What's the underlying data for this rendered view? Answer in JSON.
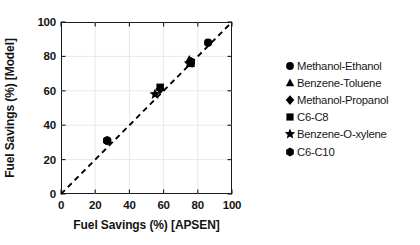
{
  "chart_data": {
    "type": "scatter",
    "title": "",
    "xlabel": "Fuel Savings (%) [APSEN]",
    "ylabel": "Fuel Savings (%) [Model]",
    "xlim": [
      0,
      100
    ],
    "ylim": [
      0,
      100
    ],
    "xticks": [
      0,
      20,
      40,
      60,
      80,
      100
    ],
    "yticks": [
      0,
      20,
      40,
      60,
      80,
      100
    ],
    "xtick_labels": [
      "0",
      "20",
      "40",
      "60",
      "80",
      "100"
    ],
    "ytick_labels": [
      "0",
      "20",
      "40",
      "60",
      "80",
      "100"
    ],
    "grid": true,
    "legend_position": "right",
    "reference_line": {
      "name": "parity-line",
      "style": "dashed",
      "from": [
        0,
        0
      ],
      "to": [
        100,
        100
      ],
      "color": "#000000"
    },
    "series": [
      {
        "name": "Methanol-Ethanol",
        "marker": "circle",
        "color": "#000000",
        "points": [
          {
            "x": 27,
            "y": 31
          },
          {
            "x": 86,
            "y": 88
          }
        ]
      },
      {
        "name": "Benzene-Toluene",
        "marker": "triangle",
        "color": "#000000",
        "points": [
          {
            "x": 75,
            "y": 78
          }
        ]
      },
      {
        "name": "Methanol-Propanol",
        "marker": "diamond",
        "color": "#000000",
        "points": [
          {
            "x": 58,
            "y": 61
          }
        ]
      },
      {
        "name": "C6-C8",
        "marker": "square",
        "color": "#000000",
        "points": [
          {
            "x": 58,
            "y": 62
          },
          {
            "x": 76,
            "y": 76
          }
        ]
      },
      {
        "name": "Benzene-O-xylene",
        "marker": "star",
        "color": "#000000",
        "points": [
          {
            "x": 55,
            "y": 58
          },
          {
            "x": 75,
            "y": 76
          }
        ]
      },
      {
        "name": "C6-C10",
        "marker": "hexagon",
        "color": "#000000",
        "points": [
          {
            "x": 27,
            "y": 31
          },
          {
            "x": 76,
            "y": 77
          }
        ]
      }
    ]
  },
  "axes": {
    "x_title": "Fuel Savings (%) [APSEN]",
    "y_title": "Fuel Savings (%) [Model]",
    "x_ticks": [
      "0",
      "20",
      "40",
      "60",
      "80",
      "100"
    ],
    "y_ticks": [
      "0",
      "20",
      "40",
      "60",
      "80",
      "100"
    ]
  },
  "legend": {
    "entries": [
      {
        "label": "Methanol-Ethanol",
        "marker": "circle"
      },
      {
        "label": "Benzene-Toluene",
        "marker": "triangle"
      },
      {
        "label": "Methanol-Propanol",
        "marker": "diamond"
      },
      {
        "label": "C6-C8",
        "marker": "square"
      },
      {
        "label": "Benzene-O-xylene",
        "marker": "star"
      },
      {
        "label": "C6-C10",
        "marker": "hexagon"
      }
    ]
  },
  "colors": {
    "marker": "#000000",
    "axis": "#1a1a1a",
    "grid": "#e2e2e2",
    "background": "#ffffff",
    "text": "#131313"
  }
}
